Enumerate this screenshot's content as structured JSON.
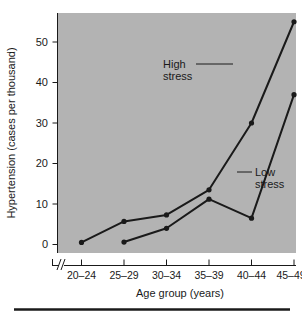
{
  "chart_data": {
    "type": "line",
    "title": "",
    "xlabel": "Age group (years)",
    "ylabel": "Hypertension (cases per thousand)",
    "categories": [
      "20–24",
      "25–29",
      "30–34",
      "35–39",
      "40–44",
      "45–49"
    ],
    "ytick_labels": [
      "0",
      "10",
      "20",
      "30",
      "40",
      "50"
    ],
    "ytick_values": [
      0,
      10,
      20,
      30,
      40,
      50
    ],
    "ylim": [
      0,
      57
    ],
    "grid": false,
    "legend_position": "inline-annotations",
    "axis_break": "//",
    "series": [
      {
        "name": "High stress",
        "values": [
          0.5,
          5.7,
          7.3,
          13.5,
          30.0,
          55.0
        ],
        "color": "#1a1a1a"
      },
      {
        "name": "Low stress",
        "values": [
          null,
          0.6,
          4.0,
          11.2,
          6.5,
          37.0
        ],
        "color": "#1a1a1a"
      }
    ],
    "annotations": [
      {
        "id": "high-stress",
        "line1": "High",
        "line2": "stress"
      },
      {
        "id": "low-stress",
        "line1": "Low",
        "line2": "stress"
      }
    ],
    "colors": {
      "plot_background": "#b3b3b3",
      "ink": "#1a1a1a",
      "page_background": "#ffffff",
      "rule": "#1a1a1a"
    }
  }
}
